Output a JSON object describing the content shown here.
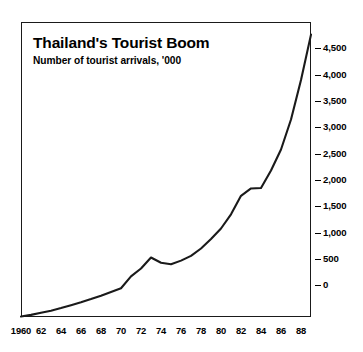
{
  "chart_data": {
    "type": "line",
    "title": "Thailand's Tourist Boom",
    "subtitle": "Number of tourist arrivals, '000",
    "xlabel": "",
    "ylabel": "",
    "grid": false,
    "legend": "none",
    "xlim": [
      1960,
      1989
    ],
    "ylim": [
      -600,
      5000
    ],
    "y_ticks": [
      0,
      500,
      1000,
      1500,
      2000,
      2500,
      3000,
      3500,
      4000,
      4500
    ],
    "y_tick_labels": [
      "0",
      "500",
      "1,000",
      "1,500",
      "2,000",
      "2,500",
      "3,000",
      "3,500",
      "4,000",
      "4,500"
    ],
    "x_ticks": [
      1960,
      1962,
      1964,
      1966,
      1968,
      1970,
      1972,
      1974,
      1976,
      1978,
      1980,
      1982,
      1984,
      1986,
      1988
    ],
    "x_tick_labels": [
      "1960",
      "62",
      "64",
      "66",
      "68",
      "70",
      "72",
      "74",
      "76",
      "78",
      "80",
      "82",
      "84",
      "86",
      "88"
    ],
    "series": [
      {
        "name": "Tourist arrivals",
        "color": "#1a1a1a",
        "x": [
          1960,
          1961,
          1962,
          1963,
          1964,
          1965,
          1966,
          1967,
          1968,
          1969,
          1970,
          1971,
          1972,
          1973,
          1974,
          1975,
          1976,
          1977,
          1978,
          1979,
          1980,
          1981,
          1982,
          1983,
          1984,
          1985,
          1986,
          1987,
          1988,
          1989
        ],
        "values": [
          -590,
          -560,
          -520,
          -480,
          -430,
          -375,
          -320,
          -260,
          -195,
          -125,
          -55,
          170,
          320,
          530,
          430,
          400,
          470,
          560,
          700,
          880,
          1080,
          1350,
          1700,
          1840,
          1850,
          2180,
          2580,
          3150,
          3900,
          4760
        ]
      }
    ]
  }
}
